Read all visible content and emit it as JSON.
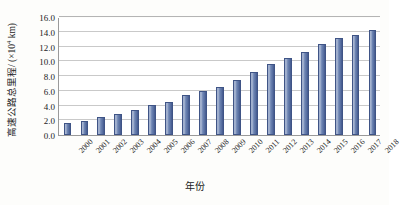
{
  "chart_data": {
    "type": "bar",
    "title": "",
    "xlabel": "年份",
    "ylabel": "高速公路总里程/ (×10⁴ km)",
    "ylabel_main": "高速公路总里程/ (×10",
    "ylabel_exp": "4",
    "ylabel_unit": " km)",
    "categories": [
      "2000",
      "2001",
      "2002",
      "2003",
      "2004",
      "2005",
      "2006",
      "2007",
      "2008",
      "2009",
      "2010",
      "2011",
      "2012",
      "2013",
      "2014",
      "2015",
      "2016",
      "2017",
      "2018"
    ],
    "values": [
      1.6,
      1.9,
      2.5,
      2.9,
      3.4,
      4.1,
      4.5,
      5.4,
      6.0,
      6.5,
      7.4,
      8.5,
      9.6,
      10.4,
      11.2,
      12.4,
      13.1,
      13.6,
      14.3
    ],
    "ylim": [
      0.0,
      16.0
    ],
    "ytick_values": [
      0.0,
      2.0,
      4.0,
      6.0,
      8.0,
      10.0,
      12.0,
      14.0,
      16.0
    ],
    "ytick_labels": [
      "0.0",
      "2.0",
      "4.0",
      "6.0",
      "8.0",
      "10.0",
      "12.0",
      "14.0",
      "16.0"
    ],
    "grid": true,
    "legend": null,
    "series_color": "#5f77ab",
    "gridline_color": "#c9c9c9",
    "axis_color": "#9a9a9a"
  }
}
